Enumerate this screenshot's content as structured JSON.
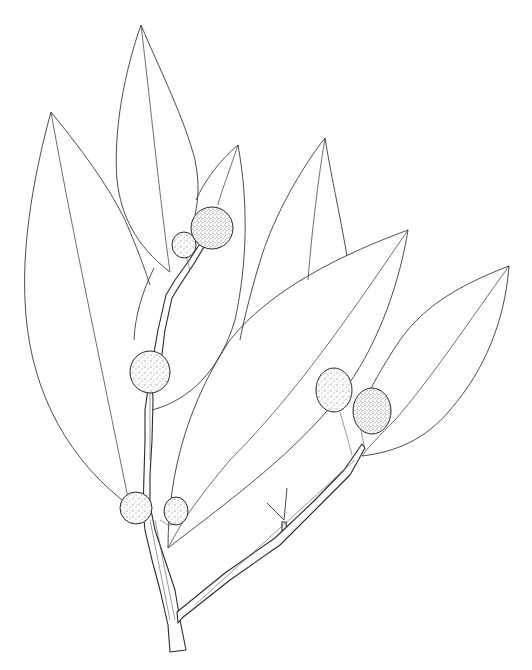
{
  "image": {
    "subject": "botanical line drawing of a leafy branch with spherical flower heads",
    "background_color": "#ffffff",
    "line_color": "#3a3a3a",
    "stipple_color": "#555555"
  },
  "leaves": [
    {
      "name": "leaf-left-large",
      "tip": [
        51,
        112
      ]
    },
    {
      "name": "leaf-top-center",
      "tip": [
        141,
        25
      ]
    },
    {
      "name": "leaf-center-small",
      "tip": [
        238,
        145
      ]
    },
    {
      "name": "leaf-upper-right",
      "tip": [
        325,
        138
      ]
    },
    {
      "name": "leaf-long-diagonal",
      "tip": [
        408,
        230
      ]
    },
    {
      "name": "leaf-far-right",
      "tip": [
        509,
        266
      ]
    }
  ],
  "flower_heads": [
    {
      "name": "flower-head-top-large",
      "cx": 212,
      "cy": 228,
      "rx": 21,
      "ry": 21
    },
    {
      "name": "flower-head-top-small",
      "cx": 184,
      "cy": 245,
      "rx": 12,
      "ry": 13
    },
    {
      "name": "flower-head-middle",
      "cx": 150,
      "cy": 372,
      "rx": 20,
      "ry": 21
    },
    {
      "name": "flower-head-lower-left",
      "cx": 136,
      "cy": 508,
      "rx": 16,
      "ry": 16
    },
    {
      "name": "flower-head-lower-small",
      "cx": 176,
      "cy": 511,
      "rx": 12,
      "ry": 14
    },
    {
      "name": "flower-head-right-a",
      "cx": 334,
      "cy": 390,
      "rx": 18,
      "ry": 22
    },
    {
      "name": "flower-head-right-b",
      "cx": 372,
      "cy": 411,
      "rx": 19,
      "ry": 23
    }
  ]
}
